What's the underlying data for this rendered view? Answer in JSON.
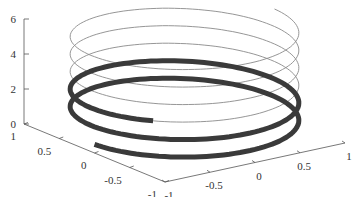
{
  "chart_data": {
    "type": "line",
    "subtype": "3d-helix",
    "title": "",
    "xlabel": "",
    "ylabel": "",
    "zlabel": "",
    "series": [
      {
        "name": "helix-lower-thick",
        "style": "thick dark",
        "color": "#3a3a3a",
        "parametric": "x=cos(t), y=sin(t), z=t/(2*pi)*1.0",
        "z_range": [
          0.5,
          2.6
        ]
      },
      {
        "name": "helix-upper-thin",
        "style": "thin gray",
        "color": "#8a8a8a",
        "parametric": "x=cos(t), y=sin(t), z=t/(2*pi)*1.0",
        "z_range": [
          2.6,
          6.0
        ]
      }
    ],
    "axes": {
      "x": {
        "range": [
          -1,
          1
        ],
        "ticks": [
          "-1",
          "-0.5",
          "0",
          "0.5",
          "1"
        ]
      },
      "y": {
        "range": [
          -1,
          1
        ],
        "ticks": [
          "1",
          "0.5",
          "0",
          "-0.5",
          "-1"
        ]
      },
      "z": {
        "range": [
          0,
          6
        ],
        "ticks": [
          "0",
          "2",
          "4",
          "6"
        ]
      }
    },
    "grid": false,
    "legend": null
  },
  "colors": {
    "thick": "#3a3a3a",
    "thin": "#8a8a8a",
    "axis": "#555555"
  }
}
